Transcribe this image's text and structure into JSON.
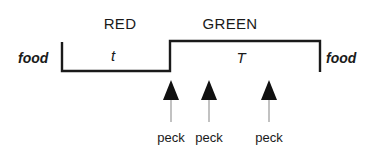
{
  "figure": {
    "background_color": "#ffffff",
    "line_color": "#1a1a1a",
    "stem_color": "#b3b3b3",
    "phases": [
      {
        "name": "red-phase",
        "label": "RED",
        "label_x": 120,
        "label_y": 16,
        "duration_symbol": "t",
        "duration_x": 113,
        "duration_y": 48
      },
      {
        "name": "green-phase",
        "label": "GREEN",
        "label_x": 230,
        "label_y": 16,
        "duration_symbol": "T",
        "duration_x": 241,
        "duration_y": 50
      }
    ],
    "food_markers": [
      {
        "name": "food-left",
        "label": "food",
        "x": 18,
        "y": 51
      },
      {
        "name": "food-right",
        "label": "food",
        "x": 326,
        "y": 51
      }
    ],
    "pecks": [
      {
        "label": "peck",
        "arrow_x": 171,
        "label_x": 171,
        "label_y": 131
      },
      {
        "label": "peck",
        "arrow_x": 209,
        "label_x": 209,
        "label_y": 131
      },
      {
        "label": "peck",
        "arrow_x": 269,
        "label_x": 269,
        "label_y": 131
      }
    ],
    "trace": {
      "low_level_y": 71,
      "high_level_y": 41,
      "start_x": 62,
      "step_x": 170,
      "end_x": 320,
      "riser_bottom_y": 72,
      "riser_top_y": 41,
      "stroke_width": 2.4
    },
    "arrow": {
      "tip_y": 80,
      "base_y": 100,
      "half_width": 8,
      "stem_bottom_y": 122,
      "stem_width": 1.6
    }
  }
}
